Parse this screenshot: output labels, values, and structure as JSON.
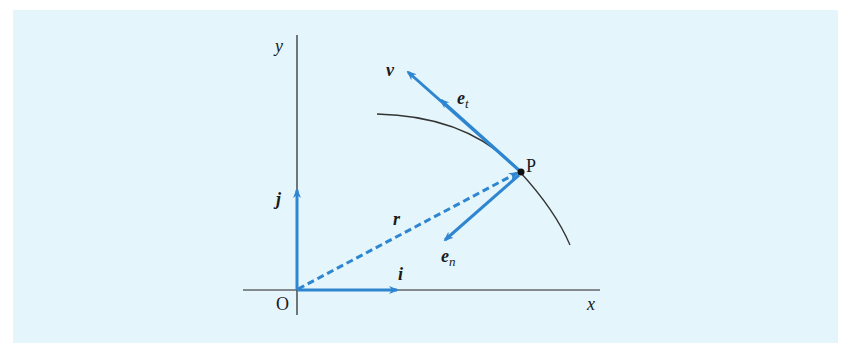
{
  "diagram": {
    "background_color": "#e4f5fb",
    "vector_color": "#2e86d1",
    "axis_color": "#222222",
    "labels": {
      "y_axis": "y",
      "x_axis": "x",
      "origin": "O",
      "point": "P",
      "velocity": "v",
      "tangent_unit": "e",
      "tangent_sub": "t",
      "normal_unit": "e",
      "normal_sub": "n",
      "position": "r",
      "i_unit": "i",
      "j_unit": "j"
    }
  }
}
